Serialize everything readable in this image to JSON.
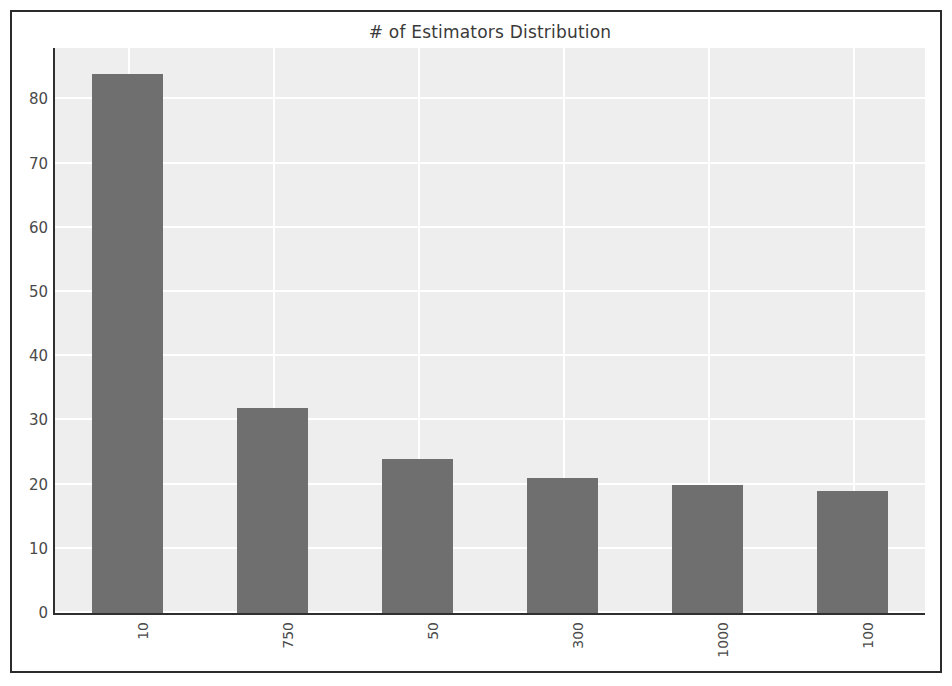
{
  "chart_data": {
    "type": "bar",
    "title": "# of Estimators Distribution",
    "xlabel": "",
    "ylabel": "",
    "categories": [
      "10",
      "750",
      "50",
      "300",
      "1000",
      "100"
    ],
    "values": [
      84,
      32,
      24,
      21,
      20,
      19
    ],
    "ylim": [
      0,
      88
    ],
    "yticks": [
      0,
      10,
      20,
      30,
      40,
      50,
      60,
      70,
      80
    ],
    "ytick_labels": [
      "0",
      "10",
      "20",
      "30",
      "40",
      "50",
      "60",
      "70",
      "80"
    ],
    "xtick_rotation": 90,
    "grid": true,
    "grid_color": "#ffffff",
    "plot_background": "#eeeeee",
    "bar_color": "#6f6f6f",
    "legend": null,
    "legend_position": "none"
  },
  "figure": {
    "background": "#ffffff",
    "frame_color": "#2b2b2b",
    "axis_color": "#2f2f2f",
    "tick_text_color": "#4a4a4a",
    "title_text_color": "#3a3a3a"
  }
}
